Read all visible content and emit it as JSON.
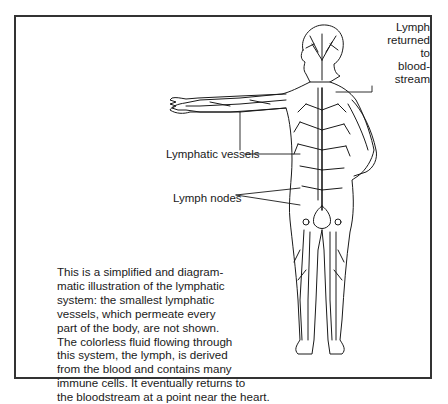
{
  "figure": {
    "labels": {
      "lymph_returned": [
        "Lymph",
        "returned",
        "to",
        "blood-",
        "stream"
      ],
      "lymphatic_vessels": "Lymphatic vessels",
      "lymph_nodes": "Lymph nodes"
    },
    "caption_lines": [
      "This is a simplified and diagram-",
      "matic illustration of the lymphatic",
      "system: the smallest lymphatic",
      "vessels, which permeate every",
      "part of the body, are not shown.",
      "The colorless fluid flowing through",
      "this system, the lymph, is derived",
      "from the blood and contains many",
      "immune cells. It eventually returns to",
      "the bloodstream at a point near the heart."
    ],
    "colors": {
      "line": "#1a1a1a",
      "frame": "#333333",
      "background": "#ffffff"
    }
  }
}
